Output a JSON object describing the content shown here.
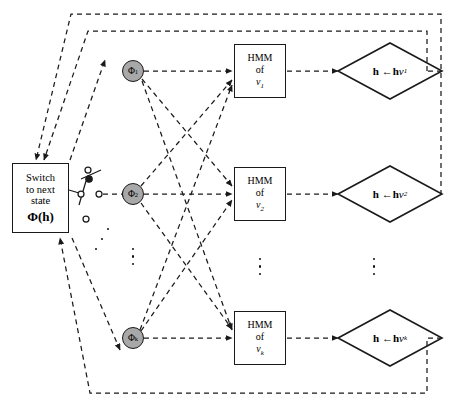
{
  "diagram": {
    "switch_box": {
      "line1": "Switch",
      "line2": "to next",
      "line3": "state",
      "formula_phi": "Φ(",
      "formula_h": "h",
      "formula_close": ")"
    },
    "state_nodes": [
      {
        "name": "phi-node-1",
        "symbol": "Φ",
        "subscript": "1"
      },
      {
        "name": "phi-node-2",
        "symbol": "Φ",
        "subscript": "2"
      },
      {
        "name": "phi-node-k",
        "symbol": "Φ",
        "subscript": "k"
      }
    ],
    "hmm_blocks": [
      {
        "name": "hmm-block-1",
        "line1": "HMM",
        "line2": "of",
        "symbol": "v",
        "subscript": "1"
      },
      {
        "name": "hmm-block-2",
        "line1": "HMM",
        "line2": "of",
        "symbol": "v",
        "subscript": "2"
      },
      {
        "name": "hmm-block-k",
        "line1": "HMM",
        "line2": "of",
        "symbol": "v",
        "subscript": "k"
      }
    ],
    "update_nodes": [
      {
        "name": "update-node-1",
        "lhs": "h",
        "arrow": "←",
        "rhs_bold": "h",
        "rhs_var": "v",
        "subscript": "1"
      },
      {
        "name": "update-node-2",
        "lhs": "h",
        "arrow": "←",
        "rhs_bold": "h",
        "rhs_var": "v",
        "subscript": "2"
      },
      {
        "name": "update-node-k",
        "lhs": "h",
        "arrow": "←",
        "rhs_bold": "h",
        "rhs_var": "v",
        "subscript": "k"
      }
    ],
    "ellipses": [
      {
        "name": "ellipsis-switch-contacts",
        "count": 3
      },
      {
        "name": "ellipsis-state-nodes",
        "count": 3
      },
      {
        "name": "ellipsis-hmm-blocks",
        "count": 3
      },
      {
        "name": "ellipsis-update-nodes",
        "count": 3
      }
    ],
    "colors": {
      "stroke": "#1a1a1a",
      "node_fill": "#a8a8a8",
      "background": "#ffffff"
    },
    "edge_style": {
      "pattern": "dashed",
      "dash": "5 4"
    }
  }
}
